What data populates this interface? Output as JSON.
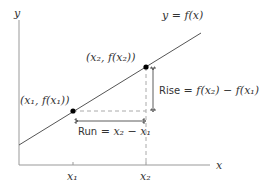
{
  "diagram": {
    "axes": {
      "x_label": "x",
      "y_label": "y"
    },
    "function_label": "y = f(x)",
    "points": [
      {
        "label": "(x₁, f(x₁))",
        "tick_label": "x₁"
      },
      {
        "label": "(x₂, f(x₂))",
        "tick_label": "x₂"
      }
    ],
    "run": {
      "label_word": "Run",
      "label_expr": " = x₂ − x₁"
    },
    "rise": {
      "label_word": "Rise",
      "label_expr": " = f(x₂) − f(x₁)"
    },
    "colors": {
      "line": "#555555",
      "axis": "#999999",
      "dashed": "#aaaaaa",
      "point": "#000000",
      "text": "#333333"
    }
  }
}
